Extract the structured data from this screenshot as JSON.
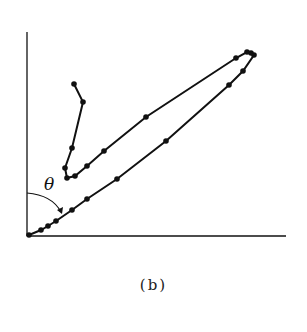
{
  "figure": {
    "caption": "(b)",
    "angle_label": "θ"
  },
  "colors": {
    "ink": "#111111",
    "background": "#ffffff"
  },
  "chart_data": {
    "type": "line",
    "title": "",
    "xlabel": "",
    "ylabel": "",
    "grid": false,
    "axes": {
      "origin_px": [
        28,
        235
      ],
      "x_end_px": 286,
      "y_top_px": 32
    },
    "annotations": [
      {
        "text": "θ",
        "meaning": "angle between y-axis and lower branch"
      }
    ],
    "series": [
      {
        "name": "trajectory",
        "points_px": [
          [
            29,
            235
          ],
          [
            41,
            230
          ],
          [
            48,
            226
          ],
          [
            56,
            221
          ],
          [
            72,
            210
          ],
          [
            87,
            199
          ],
          [
            117,
            179
          ],
          [
            166,
            141
          ],
          [
            229,
            85
          ],
          [
            243,
            71
          ],
          [
            254,
            55
          ],
          [
            251,
            53
          ],
          [
            247,
            52
          ],
          [
            236,
            58
          ],
          [
            146,
            117
          ],
          [
            104,
            151
          ],
          [
            87,
            166
          ],
          [
            75,
            176
          ],
          [
            67,
            178
          ],
          [
            65,
            168
          ],
          [
            72,
            148
          ],
          [
            83,
            102
          ],
          [
            74,
            84
          ]
        ]
      }
    ]
  }
}
